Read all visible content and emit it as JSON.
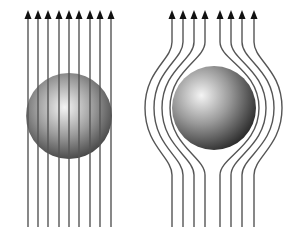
{
  "canvas": {
    "width": 298,
    "height": 233,
    "background": "#ffffff"
  },
  "colors": {
    "line": "#555555",
    "arrow": "#111111",
    "sphere_highlight": "#f4f4f4",
    "sphere_mid": "#9a9a9a",
    "sphere_shadow": "#1e1e1e"
  },
  "panels": [
    {
      "id": "field-penetrates",
      "description": "Uniform vertical field lines passing straight through the sphere",
      "sphere": {
        "cx": 69,
        "cy": 116,
        "r": 43,
        "highlight_fx": 0.45,
        "highlight_fy": 0.4
      },
      "lines": {
        "type": "straight",
        "x": [
          28,
          38,
          48,
          59,
          69,
          79,
          90,
          100,
          111
        ],
        "y_top": 14,
        "y_bottom": 227
      }
    },
    {
      "id": "field-expelled",
      "description": "Field lines bending around the sphere (field expelled)",
      "sphere": {
        "cx": 214,
        "cy": 108,
        "r": 42,
        "highlight_fx": 0.35,
        "highlight_fy": 0.35
      },
      "lines": {
        "type": "curved",
        "y_top": 14,
        "y_bottom": 227,
        "curve_start": 42,
        "curve_mid": 108,
        "curve_end": 175,
        "left": [
          {
            "x": 172,
            "bulge_x": 145
          },
          {
            "x": 183,
            "bulge_x": 154
          },
          {
            "x": 194,
            "bulge_x": 162
          },
          {
            "x": 205,
            "bulge_x": 170
          }
        ],
        "right": [
          {
            "x": 220,
            "bulge_x": 259
          },
          {
            "x": 231,
            "bulge_x": 266
          },
          {
            "x": 242,
            "bulge_x": 274
          },
          {
            "x": 254,
            "bulge_x": 282
          }
        ]
      }
    }
  ],
  "arrowhead": {
    "width": 7,
    "height": 9
  }
}
